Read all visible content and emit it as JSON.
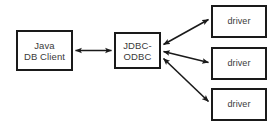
{
  "diagram": {
    "background_color": "#ffffff",
    "line_color": "#1a1a1a",
    "text_color": "#3a3a3a",
    "nodes": [
      {
        "id": "client",
        "line1": "Java",
        "line2": "DB Client"
      },
      {
        "id": "bridge",
        "line1": "JDBC-",
        "line2": "ODBC"
      },
      {
        "id": "driver1",
        "line1": "driver"
      },
      {
        "id": "driver2",
        "line1": "driver"
      },
      {
        "id": "driver3",
        "line1": "driver"
      }
    ],
    "connectors": [
      {
        "id": "client-bridge",
        "from": "client",
        "to": "bridge",
        "style": "double-headed"
      },
      {
        "id": "bridge-driver1",
        "from": "bridge",
        "to": "driver1",
        "style": "double-headed"
      },
      {
        "id": "bridge-driver2",
        "from": "bridge",
        "to": "driver2",
        "style": "double-headed"
      },
      {
        "id": "bridge-driver3",
        "from": "bridge",
        "to": "driver3",
        "style": "double-headed"
      }
    ]
  }
}
